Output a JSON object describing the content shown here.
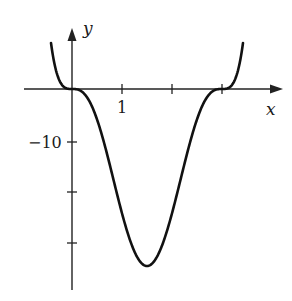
{
  "chart_data": {
    "type": "line",
    "title": "",
    "xlabel": "x",
    "ylabel": "y",
    "function": "y = 3x^3(x-3)^3",
    "x_ticks": [
      1,
      2,
      3
    ],
    "x_tick_labels": [
      "1"
    ],
    "y_ticks": [
      -10,
      -20,
      -30
    ],
    "y_tick_labels": [
      "-10"
    ],
    "xlim": [
      -0.95,
      4.2
    ],
    "ylim": [
      -36,
      11
    ],
    "grid": false,
    "legend": null,
    "series": [
      {
        "name": "curve",
        "x": [
          -0.42,
          -0.3,
          -0.2,
          0,
          0.25,
          0.5,
          0.75,
          1.0,
          1.25,
          1.5,
          1.75,
          2.0,
          2.25,
          2.5,
          2.75,
          3.0,
          3.2,
          3.3,
          3.42
        ],
        "y": [
          8.9,
          2.1,
          0.6,
          0,
          -0.6,
          -5.9,
          -17.8,
          -24.0,
          -31.5,
          -34.2,
          -31.5,
          -24.0,
          -17.8,
          -5.9,
          -0.6,
          0,
          0.6,
          2.1,
          8.9
        ]
      }
    ],
    "minimum": {
      "x": 1.5,
      "y": -34.2
    }
  },
  "labels": {
    "x_axis": "x",
    "y_axis": "y",
    "tick_x1": "1",
    "tick_y_neg10": "−10"
  }
}
